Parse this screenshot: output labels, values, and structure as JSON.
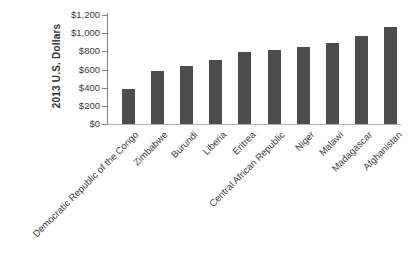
{
  "chart_data": {
    "type": "bar",
    "title": "",
    "xlabel": "",
    "ylabel": "2013 U.S. Dollars",
    "categories": [
      "Democratic Republic of the Congo",
      "Zimbabwe",
      "Burundi",
      "Liberia",
      "Eritrea",
      "Central African Republic",
      "Niger",
      "Malawi",
      "Madagascar",
      "Afghanistan"
    ],
    "values": [
      390,
      580,
      640,
      710,
      790,
      820,
      850,
      890,
      970,
      1070
    ],
    "ylim": [
      0,
      1200
    ],
    "ytick_interval": 200,
    "ytick_labels": [
      "$0",
      "$200",
      "$400",
      "$600",
      "$800",
      "$1,000",
      "$1,200"
    ],
    "grid": false,
    "legend": null,
    "bar_color": "#4d4d4d",
    "axis_color": "#808080",
    "baseline_color": "#b0b0b0",
    "text_color": "#3a3a3a"
  }
}
